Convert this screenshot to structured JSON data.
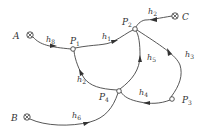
{
  "diagram": {
    "type": "flow-network",
    "sources": [
      {
        "id": "A",
        "label": "A",
        "symbol": "circle-times"
      },
      {
        "id": "B",
        "label": "B",
        "symbol": "circle-times"
      },
      {
        "id": "C",
        "label": "C",
        "symbol": "circle-times"
      }
    ],
    "nodes": [
      {
        "id": "P1",
        "label": "P",
        "sub": "1"
      },
      {
        "id": "P2",
        "label": "P",
        "sub": "2"
      },
      {
        "id": "P3",
        "label": "P",
        "sub": "3"
      },
      {
        "id": "P4",
        "label": "P",
        "sub": "4"
      }
    ],
    "edges": [
      {
        "id": "h8",
        "label": "h",
        "sub": "8",
        "from": "A",
        "to": "P1"
      },
      {
        "id": "h1",
        "label": "h",
        "sub": "1",
        "from": "P1",
        "to": "P2"
      },
      {
        "id": "h2",
        "label": "h",
        "sub": "2",
        "from": "C",
        "to": "P2"
      },
      {
        "id": "h3",
        "label": "h",
        "sub": "3",
        "from": "P3",
        "to": "P2"
      },
      {
        "id": "h5",
        "label": "h",
        "sub": "5",
        "from": "P4",
        "to": "P2"
      },
      {
        "id": "h4",
        "label": "h",
        "sub": "4",
        "from": "P3",
        "to": "P4"
      },
      {
        "id": "h2b",
        "label": "h",
        "sub": "2",
        "from": "P4",
        "to": "P1"
      },
      {
        "id": "h6",
        "label": "h",
        "sub": "6",
        "from": "B",
        "to": "P4"
      }
    ]
  }
}
